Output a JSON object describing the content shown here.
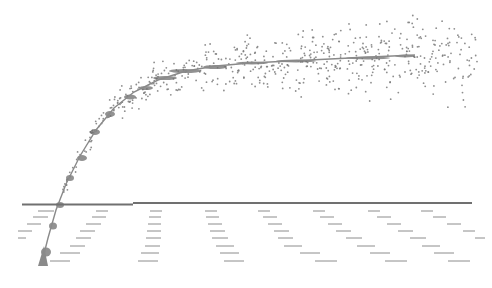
{
  "diagram": {
    "width": 492,
    "height": 288,
    "colors": {
      "background": "#ffffff",
      "curve": "#8a8a8a",
      "cluster": "#6e6e6e",
      "dots": "#7a7a7a",
      "baseline": "#707070",
      "dashes": "#8c8c8c",
      "wedge": "#8a8a8a"
    },
    "baseline": {
      "x1": 22,
      "x2": 472,
      "y": 203,
      "step_x": 133,
      "y_left": 204.5
    },
    "curve": {
      "points": [
        [
          42,
          262
        ],
        [
          48,
          238
        ],
        [
          56,
          210
        ],
        [
          66,
          184
        ],
        [
          80,
          156
        ],
        [
          96,
          130
        ],
        [
          114,
          108
        ],
        [
          134,
          92
        ],
        [
          158,
          80
        ],
        [
          186,
          71
        ],
        [
          216,
          66
        ],
        [
          250,
          63
        ],
        [
          290,
          61
        ],
        [
          330,
          59
        ],
        [
          370,
          57
        ],
        [
          415,
          55
        ]
      ]
    },
    "clusters": [
      [
        46,
        252,
        5,
        9
      ],
      [
        53,
        226,
        4,
        7
      ],
      [
        60,
        205,
        4,
        6
      ],
      [
        70,
        178,
        4,
        6
      ],
      [
        82,
        158,
        5,
        6
      ],
      [
        95,
        132,
        5,
        6
      ],
      [
        110,
        114,
        5,
        6
      ],
      [
        130,
        97,
        6,
        5
      ],
      [
        146,
        88,
        7,
        4
      ],
      [
        165,
        78,
        12,
        4
      ],
      [
        185,
        71,
        16,
        4
      ],
      [
        215,
        67,
        12,
        4
      ],
      [
        252,
        63,
        16,
        3
      ],
      [
        296,
        61,
        20,
        3
      ],
      [
        368,
        58,
        22,
        3
      ],
      [
        405,
        56,
        10,
        3
      ]
    ],
    "dash_rows": {
      "row_ys": [
        211,
        217,
        224,
        231,
        238,
        246,
        253,
        261
      ],
      "columns": [
        {
          "xs": [
            38,
            33,
            27,
            18,
            18,
            0,
            0,
            0
          ],
          "w": [
            16,
            15,
            14,
            14,
            8,
            0,
            0,
            0
          ]
        },
        {
          "xs": [
            96,
            92,
            86,
            80,
            76,
            70,
            60,
            50
          ],
          "w": [
            12,
            14,
            15,
            15,
            15,
            15,
            20,
            20
          ]
        },
        {
          "xs": [
            150,
            149,
            148,
            147,
            146,
            145,
            141,
            138
          ],
          "w": [
            12,
            12,
            13,
            14,
            15,
            15,
            18,
            20
          ]
        },
        {
          "xs": [
            205,
            206,
            208,
            210,
            212,
            216,
            220,
            224
          ],
          "w": [
            12,
            13,
            14,
            15,
            16,
            18,
            19,
            20
          ]
        },
        {
          "xs": [
            258,
            263,
            268,
            274,
            278,
            284,
            300,
            315
          ],
          "w": [
            12,
            14,
            14,
            15,
            15,
            18,
            20,
            22
          ]
        },
        {
          "xs": [
            313,
            320,
            328,
            336,
            346,
            357,
            370,
            385
          ],
          "w": [
            12,
            14,
            14,
            15,
            16,
            18,
            20,
            22
          ]
        },
        {
          "xs": [
            368,
            377,
            387,
            398,
            410,
            422,
            434,
            448
          ],
          "w": [
            12,
            14,
            14,
            15,
            16,
            18,
            20,
            22
          ]
        },
        {
          "xs": [
            421,
            433,
            447,
            463,
            475,
            0,
            0,
            0
          ],
          "w": [
            12,
            13,
            14,
            12,
            10,
            0,
            0,
            0
          ]
        }
      ]
    },
    "wedge": {
      "points": [
        [
          38,
          266
        ],
        [
          48,
          266
        ],
        [
          44,
          246
        ]
      ]
    },
    "scatter_seed": 7,
    "scatter_count": 620
  }
}
